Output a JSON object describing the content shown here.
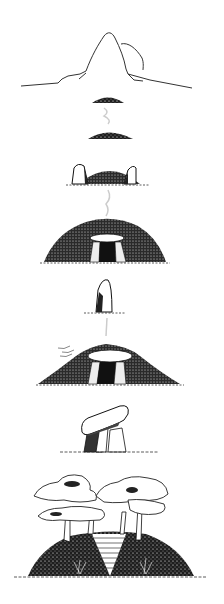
{
  "illustration": {
    "style": "pen-and-ink",
    "background": "#ffffff",
    "ink": "#1a1a1a",
    "stages": [
      {
        "id": "mountain",
        "icon": "mountain-outline-icon"
      },
      {
        "id": "small-mound-1",
        "icon": "mound-icon"
      },
      {
        "id": "small-mound-2",
        "icon": "mound-icon"
      },
      {
        "id": "mound-with-stones",
        "icon": "mound-stones-icon"
      },
      {
        "id": "dolmen-mound",
        "icon": "dolmen-mound-icon"
      },
      {
        "id": "standing-stone",
        "icon": "menhir-icon"
      },
      {
        "id": "eroded-dolmen-mound",
        "icon": "dolmen-mound-icon"
      },
      {
        "id": "exposed-dolmen",
        "icon": "dolmen-icon"
      },
      {
        "id": "tree-covered-mound",
        "icon": "tree-mound-icon"
      }
    ]
  }
}
